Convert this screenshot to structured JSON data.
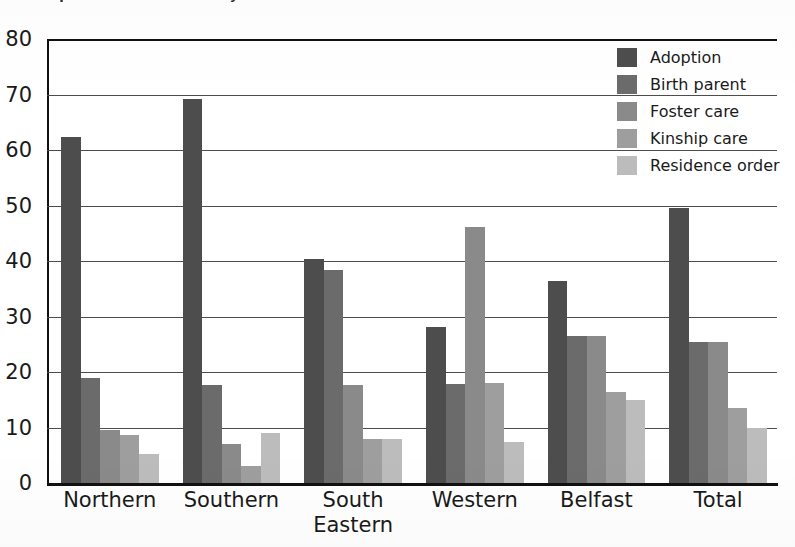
{
  "figure": {
    "title_sliver": "Chart: placement outcomes by HSC trust",
    "background_color": "#ffffff"
  },
  "chart_data": {
    "type": "bar",
    "title": "",
    "xlabel": "",
    "ylabel": "",
    "ylim": [
      0,
      80
    ],
    "yticks": [
      0,
      10,
      20,
      30,
      40,
      50,
      60,
      70,
      80
    ],
    "ytick_labels": [
      "0",
      "10",
      "20",
      "30",
      "40",
      "50",
      "60",
      "70",
      "80"
    ],
    "grid": true,
    "grid_axis": "y",
    "legend_position": "upper right",
    "categories": [
      "Northern",
      "Southern",
      "South\nEastern",
      "Western",
      "Belfast",
      "Total"
    ],
    "series": [
      {
        "name": "Adoption",
        "color": "#4d4d4d",
        "values": [
          62.3,
          69.2,
          40.4,
          28.1,
          36.4,
          49.5
        ]
      },
      {
        "name": "Birth parent",
        "color": "#6b6b6b",
        "values": [
          19.0,
          17.6,
          38.4,
          17.9,
          26.5,
          25.4
        ]
      },
      {
        "name": "Foster care",
        "color": "#8a8a8a",
        "values": [
          9.6,
          7.0,
          17.6,
          46.1,
          26.5,
          25.4
        ]
      },
      {
        "name": "Kinship care",
        "color": "#9e9e9e",
        "values": [
          8.6,
          3.0,
          8.0,
          18.0,
          16.4,
          13.5
        ]
      },
      {
        "name": "Residence order",
        "color": "#bcbcbc",
        "values": [
          5.2,
          9.1,
          8.0,
          7.4,
          14.9,
          9.9
        ]
      }
    ]
  },
  "legend": {
    "items": [
      {
        "label": "Adoption",
        "color": "#4d4d4d"
      },
      {
        "label": "Birth parent",
        "color": "#6b6b6b"
      },
      {
        "label": "Foster care",
        "color": "#8a8a8a"
      },
      {
        "label": "Kinship care",
        "color": "#9e9e9e"
      },
      {
        "label": "Residence order",
        "color": "#bcbcbc"
      }
    ]
  },
  "axes": {
    "y_axis_color": "#111111",
    "x_axis_color": "#111111",
    "gridline_color": "#4d4d4d"
  }
}
